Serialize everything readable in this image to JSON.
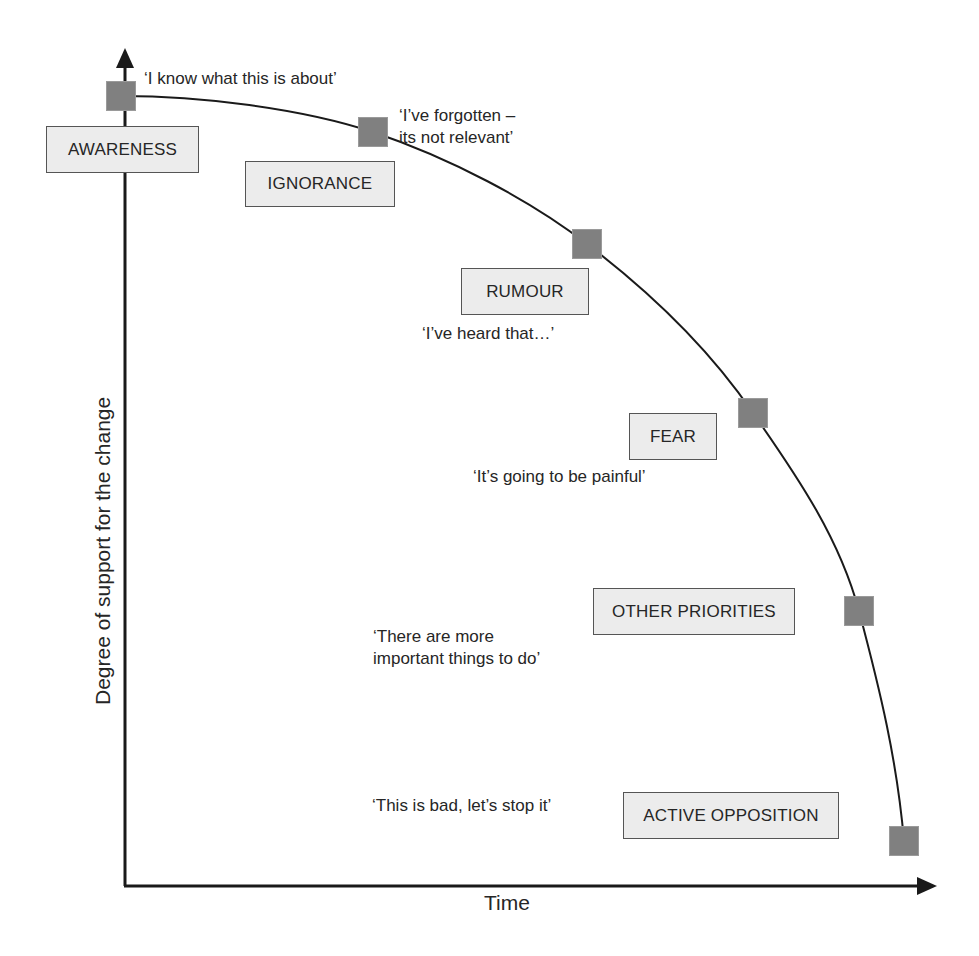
{
  "diagram": {
    "x_axis_label": "Time",
    "y_axis_label": "Degree of support for the change",
    "colors": {
      "axis": "#1a1a1a",
      "curve": "#1a1a1a",
      "marker": "#808080",
      "box_fill": "#ececec",
      "box_border": "#555555",
      "text": "#262626"
    },
    "stages": [
      {
        "label": "AWARENESS",
        "quote": "‘I know what this is about’"
      },
      {
        "label": "IGNORANCE",
        "quote": "‘I’ve forgotten –\nits not relevant’"
      },
      {
        "label": "RUMOUR",
        "quote": "‘I’ve heard that…’"
      },
      {
        "label": "FEAR",
        "quote": "‘It’s going to be painful’"
      },
      {
        "label": "OTHER PRIORITIES",
        "quote": "‘There are more\nimportant things to do’"
      },
      {
        "label": "ACTIVE OPPOSITION",
        "quote": "‘This is bad, let’s stop it’"
      }
    ]
  }
}
